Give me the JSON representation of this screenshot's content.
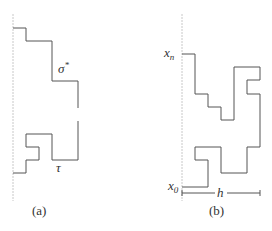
{
  "panels": [
    {
      "id": "a",
      "caption": "(a)",
      "path_label_upper": "σ",
      "path_label_upper_sup": "*",
      "path_label_lower": "τ"
    },
    {
      "id": "b",
      "caption": "(b)",
      "start_label": "x",
      "start_sub": "0",
      "end_label": "x",
      "end_sub": "n",
      "width_label": "h"
    }
  ],
  "colors": {
    "path": "#555555",
    "axis": "#bbbbbb",
    "text": "#333333"
  }
}
